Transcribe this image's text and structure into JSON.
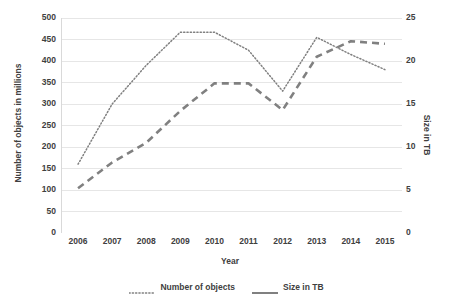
{
  "chart_data": {
    "type": "line",
    "title": "",
    "xlabel": "Year",
    "categories": [
      "2006",
      "2007",
      "2008",
      "2009",
      "2010",
      "2011",
      "2012",
      "2013",
      "2014",
      "2015"
    ],
    "x": [
      2006,
      2007,
      2008,
      2009,
      2010,
      2011,
      2012,
      2013,
      2014,
      2015
    ],
    "grid": true,
    "legend_position": "bottom",
    "axes": {
      "left": {
        "label": "Number of objects in millions",
        "ticks": [
          0,
          50,
          100,
          150,
          200,
          250,
          300,
          350,
          400,
          450,
          500
        ],
        "ylim": [
          0,
          500
        ]
      },
      "right": {
        "label": "Size in TB",
        "ticks": [
          0,
          5,
          10,
          15,
          20,
          25
        ],
        "ylim": [
          0,
          25
        ]
      }
    },
    "series": [
      {
        "name": "Number of objects",
        "axis": "left",
        "style": "dotted",
        "color": "#808080",
        "values": [
          160,
          300,
          390,
          467,
          467,
          425,
          330,
          455,
          415,
          380
        ]
      },
      {
        "name": "Size in TB",
        "axis": "right",
        "style": "dashed",
        "color": "#808080",
        "values": [
          5.2,
          8.2,
          10.5,
          14.2,
          17.4,
          17.4,
          14.3,
          20.5,
          22.3,
          22.0
        ]
      }
    ]
  },
  "axis_titles": {
    "left": "Number of objects in millions",
    "right": "Size in TB",
    "x": "Year"
  },
  "legend": {
    "items": [
      {
        "label": "Number of objects",
        "marker": "dotted-line-icon"
      },
      {
        "label": "Size in TB",
        "marker": "solid-line-icon"
      }
    ]
  },
  "colors": {
    "series_line": "#808080",
    "gridline": "#e6e6e6",
    "axis_line": "#d9d9d9",
    "text": "#404040",
    "background": "#ffffff"
  }
}
